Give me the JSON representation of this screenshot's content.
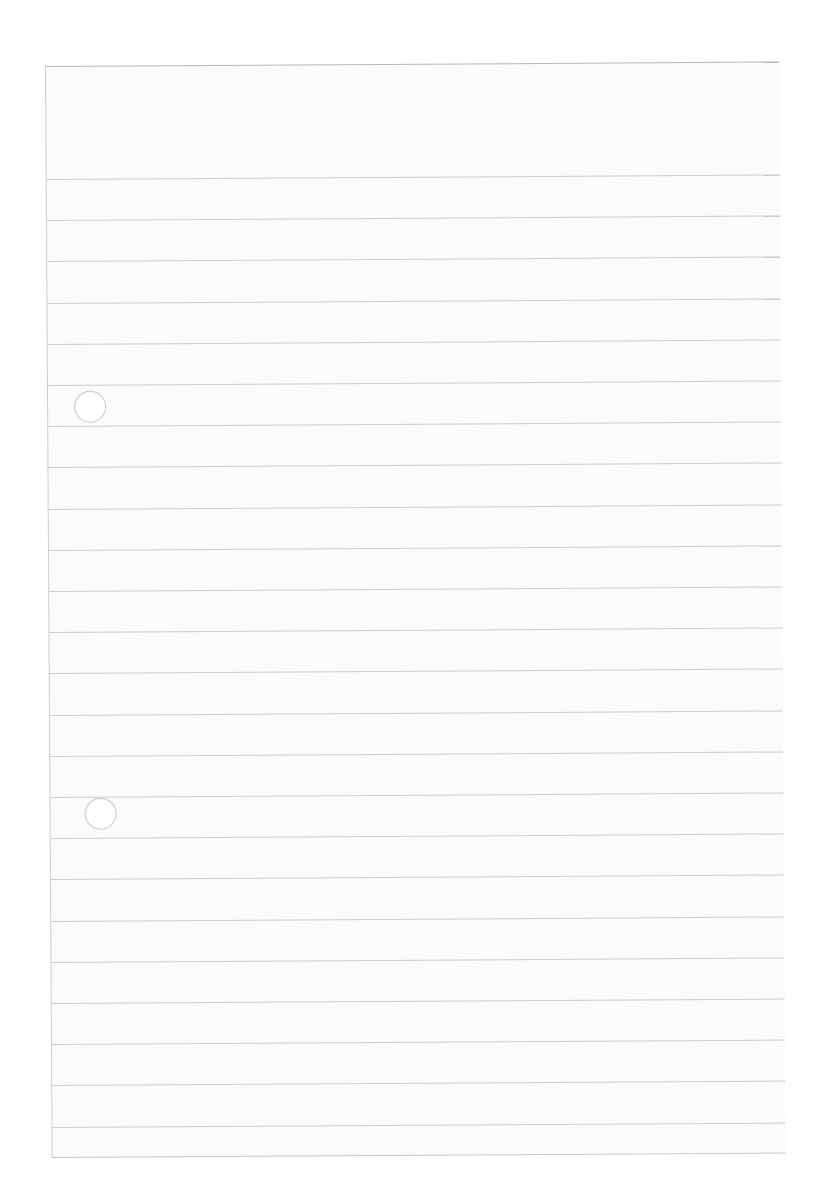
{
  "page": {
    "type": "blank lined paper",
    "rule_count": 24,
    "first_rule_offset": 112,
    "rule_spacing": 41.2,
    "punch_holes": [
      {
        "x": 26,
        "y": 324
      },
      {
        "x": 34,
        "y": 731
      }
    ],
    "colors": {
      "paper": "#fbfbfa",
      "rule": "#cdcdcd",
      "edge": "#b9b9b9"
    }
  }
}
